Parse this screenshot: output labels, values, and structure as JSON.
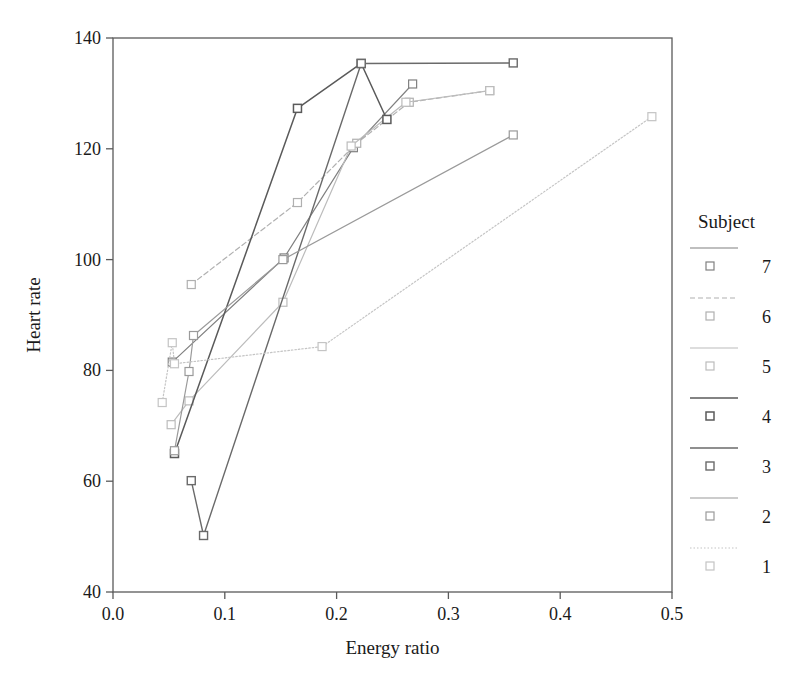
{
  "chart_data": {
    "type": "line",
    "title": "",
    "xlabel": "Energy ratio",
    "ylabel": "Heart rate",
    "xlim": [
      0.0,
      0.5
    ],
    "ylim": [
      40,
      140
    ],
    "xticks": [
      "0.0",
      "0.1",
      "0.2",
      "0.3",
      "0.4",
      "0.5"
    ],
    "xtick_values": [
      0.0,
      0.1,
      0.2,
      0.3,
      0.4,
      0.5
    ],
    "yticks": [
      "40",
      "60",
      "80",
      "100",
      "120",
      "140"
    ],
    "ytick_values": [
      40,
      60,
      80,
      100,
      120,
      140
    ],
    "grid": false,
    "legend_title": "Subject",
    "legend_position": "right",
    "marker": "open-square",
    "series": [
      {
        "name": "7",
        "label": "7",
        "color": "#808080",
        "dash": "none",
        "width": 1.2,
        "points": [
          {
            "x": 0.053,
            "y": 81.5
          },
          {
            "x": 0.153,
            "y": 100.3
          },
          {
            "x": 0.215,
            "y": 120.2
          },
          {
            "x": 0.268,
            "y": 131.7
          }
        ]
      },
      {
        "name": "6",
        "label": "6",
        "color": "#b0b0b0",
        "dash": "5,3",
        "width": 1.2,
        "points": [
          {
            "x": 0.07,
            "y": 95.5
          },
          {
            "x": 0.165,
            "y": 110.3
          },
          {
            "x": 0.218,
            "y": 121.0
          },
          {
            "x": 0.265,
            "y": 128.4
          },
          {
            "x": 0.337,
            "y": 130.5
          }
        ]
      },
      {
        "name": "5",
        "label": "5",
        "color": "#bcbcbc",
        "dash": "none",
        "width": 1.2,
        "points": [
          {
            "x": 0.052,
            "y": 70.2
          },
          {
            "x": 0.068,
            "y": 74.5
          },
          {
            "x": 0.152,
            "y": 92.3
          },
          {
            "x": 0.213,
            "y": 120.5
          },
          {
            "x": 0.262,
            "y": 128.4
          },
          {
            "x": 0.337,
            "y": 130.5
          }
        ]
      },
      {
        "name": "4",
        "label": "4",
        "color": "#5a5a5a",
        "dash": "none",
        "width": 1.5,
        "points": [
          {
            "x": 0.055,
            "y": 65.0
          },
          {
            "x": 0.165,
            "y": 127.3
          },
          {
            "x": 0.222,
            "y": 135.4
          },
          {
            "x": 0.245,
            "y": 125.3
          }
        ]
      },
      {
        "name": "3",
        "label": "3",
        "color": "#6a6a6a",
        "dash": "none",
        "width": 1.4,
        "points": [
          {
            "x": 0.07,
            "y": 60.1
          },
          {
            "x": 0.081,
            "y": 50.2
          },
          {
            "x": 0.222,
            "y": 135.4
          },
          {
            "x": 0.358,
            "y": 135.5
          }
        ]
      },
      {
        "name": "2",
        "label": "2",
        "color": "#9a9a9a",
        "dash": "none",
        "width": 1.2,
        "points": [
          {
            "x": 0.055,
            "y": 65.5
          },
          {
            "x": 0.068,
            "y": 79.8
          },
          {
            "x": 0.072,
            "y": 86.3
          },
          {
            "x": 0.152,
            "y": 100.0
          },
          {
            "x": 0.358,
            "y": 122.5
          }
        ]
      },
      {
        "name": "1",
        "label": "1",
        "color": "#c4c4c4",
        "dash": "1.5,2",
        "width": 1.2,
        "points": [
          {
            "x": 0.044,
            "y": 74.2
          },
          {
            "x": 0.053,
            "y": 85.0
          },
          {
            "x": 0.055,
            "y": 81.2
          },
          {
            "x": 0.187,
            "y": 84.3
          },
          {
            "x": 0.482,
            "y": 125.8
          }
        ]
      }
    ]
  },
  "legend": {
    "title": "Subject",
    "entries": [
      {
        "label": "7"
      },
      {
        "label": "6"
      },
      {
        "label": "5"
      },
      {
        "label": "4"
      },
      {
        "label": "3"
      },
      {
        "label": "2"
      },
      {
        "label": "1"
      }
    ]
  }
}
